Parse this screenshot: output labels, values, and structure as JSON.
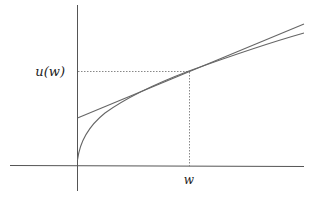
{
  "diagram": {
    "type": "concave utility function with tangent line",
    "labels": {
      "y_point": "u(w)",
      "x_point": "w"
    },
    "colors": {
      "axis": "#555555",
      "curve": "#666666",
      "tangent": "#666666",
      "guide": "#888888",
      "text": "#222222"
    }
  }
}
